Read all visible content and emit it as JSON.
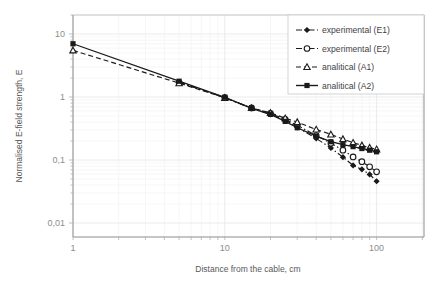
{
  "chart_data": {
    "type": "line",
    "title": "",
    "xlabel": "Distance from the cable, cm",
    "ylabel": "Normalised E-field strength, E",
    "xscale": "log",
    "yscale": "log",
    "xlim": [
      1,
      200
    ],
    "ylim": [
      0.01,
      20
    ],
    "xticks": [
      "1",
      "10",
      "100"
    ],
    "xtick_values": [
      1,
      10,
      100
    ],
    "yticks": [
      "10",
      "1",
      "0,1",
      "0,01"
    ],
    "ytick_values": [
      10,
      1,
      0.1,
      0.01
    ],
    "grid": true,
    "minor_grid": true,
    "legend_position": "top-right",
    "decimal_separator": ",",
    "series": [
      {
        "name": "experimental (E1)",
        "marker": "filled-diamond",
        "linestyle": "dash-dot",
        "color": "#1a1a1a",
        "x": [
          5,
          10,
          15,
          20,
          25,
          30,
          40,
          50,
          60,
          70,
          80,
          90,
          100
        ],
        "y": [
          1.72,
          0.98,
          0.66,
          0.53,
          0.43,
          0.33,
          0.22,
          0.155,
          0.111,
          0.082,
          0.071,
          0.059,
          0.046
        ]
      },
      {
        "name": "experimental (E2)",
        "marker": "open-circle",
        "linestyle": "dash-dot",
        "color": "#1a1a1a",
        "x": [
          5,
          10,
          15,
          20,
          25,
          30,
          40,
          50,
          60,
          70,
          80,
          90,
          100
        ],
        "y": [
          1.7,
          0.98,
          0.67,
          0.55,
          0.44,
          0.355,
          0.245,
          0.185,
          0.143,
          0.112,
          0.094,
          0.078,
          0.065
        ]
      },
      {
        "name": "analitical (A1)",
        "marker": "open-triangle",
        "linestyle": "dashed",
        "color": "#1a1a1a",
        "x": [
          1,
          5,
          10,
          15,
          20,
          25,
          30,
          40,
          50,
          60,
          70,
          80,
          90,
          100
        ],
        "y": [
          5.5,
          1.66,
          0.97,
          0.67,
          0.56,
          0.46,
          0.4,
          0.305,
          0.255,
          0.215,
          0.188,
          0.171,
          0.157,
          0.148
        ]
      },
      {
        "name": "analitical (A2)",
        "marker": "filled-square",
        "linestyle": "solid",
        "color": "#1a1a1a",
        "x": [
          1,
          5,
          10,
          15,
          20,
          25,
          30,
          40,
          50,
          60,
          70,
          80,
          90,
          100
        ],
        "y": [
          7.0,
          1.78,
          0.99,
          0.66,
          0.53,
          0.41,
          0.325,
          0.24,
          0.195,
          0.175,
          0.163,
          0.152,
          0.143,
          0.135
        ]
      }
    ]
  },
  "legend": {
    "items": [
      {
        "label": "experimental (E1)"
      },
      {
        "label": "experimental (E2)"
      },
      {
        "label": "analitical (A1)"
      },
      {
        "label": "analitical (A2)"
      }
    ]
  },
  "axes": {
    "x_title": "Distance from the cable, cm",
    "y_title": "Normalised E-field strength, E",
    "x_tick_labels": [
      "1",
      "10",
      "100"
    ],
    "y_tick_labels": [
      "10",
      "1",
      "0,1",
      "0,01"
    ]
  },
  "colors": {
    "series": "#1a1a1a",
    "grid": "#e8e8e8",
    "minor_grid": "#f2f2f2",
    "axis": "#bfbfbf",
    "text": "#595959",
    "tick_text": "#8c8c8c",
    "background": "#ffffff"
  }
}
